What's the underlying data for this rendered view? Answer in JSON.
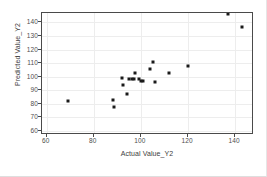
{
  "chart_data": {
    "type": "scatter",
    "title": "",
    "xlabel": "Actual Value_Y2",
    "ylabel": "Predicted Value_Y2",
    "xlim": [
      58,
      148
    ],
    "ylim": [
      57,
      147
    ],
    "xticks": [
      60,
      80,
      100,
      120,
      140
    ],
    "yticks": [
      60,
      70,
      80,
      90,
      100,
      110,
      120,
      130,
      140
    ],
    "grid": true,
    "grid_color": "#ededed",
    "marker_color": "#1a1a1a",
    "legend": "none",
    "points": [
      {
        "x": 69,
        "y": 82
      },
      {
        "x": 88,
        "y": 83
      },
      {
        "x": 88.5,
        "y": 78
      },
      {
        "x": 92,
        "y": 99
      },
      {
        "x": 92.5,
        "y": 94
      },
      {
        "x": 94,
        "y": 87
      },
      {
        "x": 95,
        "y": 98
      },
      {
        "x": 96,
        "y": 98
      },
      {
        "x": 97,
        "y": 98
      },
      {
        "x": 97.5,
        "y": 103
      },
      {
        "x": 99,
        "y": 98
      },
      {
        "x": 100,
        "y": 97
      },
      {
        "x": 101,
        "y": 97
      },
      {
        "x": 104,
        "y": 106
      },
      {
        "x": 105,
        "y": 111
      },
      {
        "x": 106,
        "y": 96
      },
      {
        "x": 112,
        "y": 103
      },
      {
        "x": 120,
        "y": 108
      },
      {
        "x": 137,
        "y": 146
      },
      {
        "x": 143,
        "y": 137
      }
    ]
  },
  "axes": {
    "x_title": "Actual Value_Y2",
    "y_title": "Predicted Value_Y2",
    "x_tick_labels": [
      "60",
      "80",
      "100",
      "120",
      "140"
    ],
    "y_tick_labels": [
      "60",
      "70",
      "80",
      "90",
      "100",
      "110",
      "120",
      "130",
      "140"
    ]
  }
}
